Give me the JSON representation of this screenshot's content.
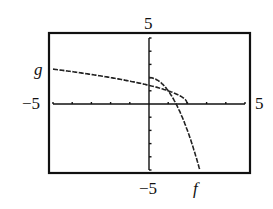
{
  "chart_data": {
    "type": "line",
    "title": "",
    "xlabel": "",
    "ylabel": "",
    "xlim": [
      -5,
      5
    ],
    "ylim": [
      -5,
      5
    ],
    "grid": false,
    "legend": "inline curve labels",
    "tick_labels": {
      "x_min": "−5",
      "x_max": "5",
      "y_max": "5",
      "y_min": "−5"
    },
    "tick_step": 1,
    "series": [
      {
        "name": "g",
        "formula": "sqrt(2 - x)",
        "x": [
          -5,
          -4,
          -3,
          -2,
          -1,
          0,
          1,
          2
        ],
        "y": [
          2.65,
          2.45,
          2.24,
          2.0,
          1.73,
          1.41,
          1.0,
          0.0
        ]
      },
      {
        "name": "f",
        "formula": "2 - x^2",
        "x": [
          0,
          0.5,
          1,
          1.41,
          2,
          2.5,
          2.65
        ],
        "y": [
          2.0,
          1.75,
          1.0,
          0.0,
          -2.0,
          -4.25,
          -5.0
        ]
      }
    ]
  },
  "labels": {
    "y_top": "5",
    "y_bottom": "−5",
    "x_left": "−5",
    "x_right": "5",
    "curve_g": "g",
    "curve_f": "f"
  }
}
